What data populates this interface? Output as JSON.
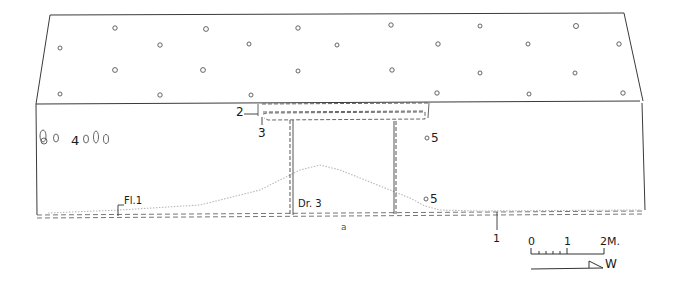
{
  "drawing": {
    "caption": "a",
    "labels": {
      "two": "2",
      "three": "3",
      "four": "4",
      "five_upper": "5",
      "five_lower": "5",
      "floor": "Fl.1",
      "door": "Dr. 3",
      "one": "1"
    },
    "scale_bar": {
      "ticks": [
        "0",
        "1",
        "2M."
      ],
      "unit": "M",
      "minor_divisions": 5
    },
    "orientation": {
      "direction": "W"
    },
    "colors": {
      "line": "#3a3a3a",
      "faint": "#b8b8b8",
      "text": "#1a1a1a",
      "background": "#ffffff"
    }
  }
}
